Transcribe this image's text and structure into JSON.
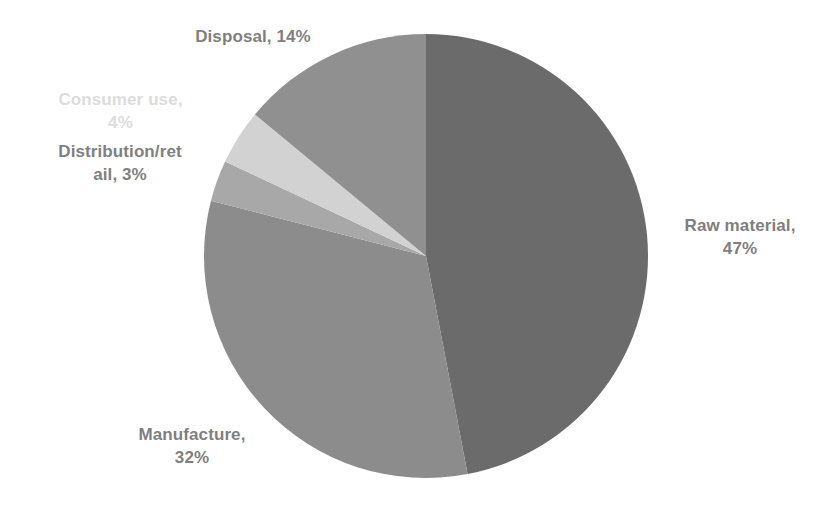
{
  "chart_data": {
    "type": "pie",
    "title": "",
    "labels": [
      "Raw material",
      "Manufacture",
      "Distribution/retail",
      "Consumer use",
      "Disposal"
    ],
    "values": [
      47,
      32,
      3,
      4,
      14
    ],
    "value_unit": "%",
    "slice_colors": [
      "#6b6b6b",
      "#8c8c8c",
      "#a8a8a8",
      "#d2d2d2",
      "#909090"
    ],
    "start_angle_deg": 0,
    "direction": "clockwise",
    "legend": "none",
    "grid": false,
    "data_labels": [
      {
        "text": "Raw material,\n47%",
        "category": "Raw material",
        "value": 47,
        "color": "#7f7f7f",
        "position": "outside-right"
      },
      {
        "text": "Manufacture,\n32%",
        "category": "Manufacture",
        "value": 32,
        "color": "#7f7f7f",
        "position": "outside-bottom-left"
      },
      {
        "text": "Distribution/ret\nail, 3%",
        "category": "Distribution/retail",
        "value": 3,
        "color": "#808080",
        "position": "outside-left"
      },
      {
        "text": "Consumer use,\n4%",
        "category": "Consumer use",
        "value": 4,
        "color": "#dcdcdc",
        "position": "outside-left"
      },
      {
        "text": "Disposal, 14%",
        "category": "Disposal",
        "value": 14,
        "color": "#7f7f7f",
        "position": "outside-top-left"
      }
    ],
    "geometry": {
      "center_x": 426,
      "center_y": 256,
      "radius": 222
    },
    "background_color": "#ffffff"
  },
  "labels": {
    "disposal": "Disposal, 14%",
    "consumer_use": "Consumer use,\n4%",
    "distribution_retail": "Distribution/ret\nail, 3%",
    "raw_material": "Raw material,\n47%",
    "manufacture": "Manufacture,\n32%"
  }
}
